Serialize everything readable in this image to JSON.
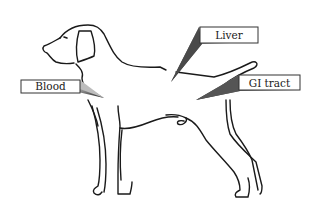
{
  "diagram": {
    "labels": [
      {
        "id": "liver",
        "text": "Liver"
      },
      {
        "id": "blood",
        "text": "Blood"
      },
      {
        "id": "gi",
        "text": "GI tract"
      }
    ],
    "colors": {
      "outline": "#1a1a1a",
      "wedge_dark": "#2a2a2a",
      "wedge_light": "#d8d8d8",
      "label_border": "#333333",
      "background": "#ffffff"
    }
  }
}
